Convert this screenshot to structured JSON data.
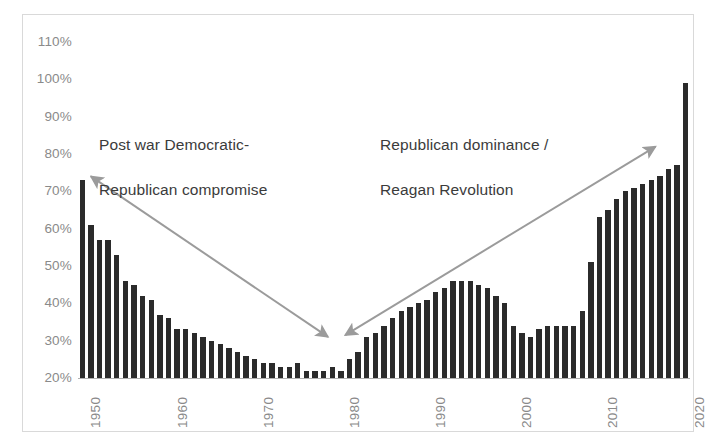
{
  "chart_data": {
    "type": "bar",
    "title": "",
    "subtitle": "",
    "xlabel": "",
    "ylabel": "",
    "ylim": [
      20,
      110
    ],
    "ytick_labels": [
      "110%",
      "100%",
      "90%",
      "80%",
      "70%",
      "60%",
      "50%",
      "40%",
      "30%",
      "20%"
    ],
    "ytick_values": [
      110,
      100,
      90,
      80,
      70,
      60,
      50,
      40,
      30,
      20
    ],
    "xtick_labels": [
      "1950",
      "1960",
      "1970",
      "1980",
      "1990",
      "2000",
      "2010",
      "2020"
    ],
    "xtick_values": [
      1950,
      1960,
      1970,
      1980,
      1990,
      2000,
      2010,
      2020
    ],
    "grid": false,
    "legend": null,
    "bar_color": "#2b2b2b",
    "x": [
      1950,
      1951,
      1952,
      1953,
      1954,
      1955,
      1956,
      1957,
      1958,
      1959,
      1960,
      1961,
      1962,
      1963,
      1964,
      1965,
      1966,
      1967,
      1968,
      1969,
      1970,
      1971,
      1972,
      1973,
      1974,
      1975,
      1976,
      1977,
      1978,
      1979,
      1980,
      1981,
      1982,
      1983,
      1984,
      1985,
      1986,
      1987,
      1988,
      1989,
      1990,
      1991,
      1992,
      1993,
      1994,
      1995,
      1996,
      1997,
      1998,
      1999,
      2000,
      2001,
      2002,
      2003,
      2004,
      2005,
      2006,
      2007,
      2008,
      2009,
      2010,
      2011,
      2012,
      2013,
      2014,
      2015,
      2016,
      2017,
      2018,
      2019,
      2020
    ],
    "values": [
      73,
      61,
      57,
      57,
      53,
      46,
      45,
      42,
      41,
      37,
      36,
      33,
      33,
      32,
      31,
      30,
      29,
      28,
      27,
      26,
      25,
      24,
      24,
      23,
      23,
      24,
      22,
      22,
      22,
      23,
      22,
      25,
      27,
      31,
      32,
      34,
      36,
      38,
      39,
      40,
      41,
      43,
      44,
      46,
      46,
      46,
      45,
      44,
      42,
      40,
      34,
      32,
      31,
      33,
      34,
      34,
      34,
      34,
      38,
      51,
      63,
      65,
      68,
      70,
      71,
      72,
      73,
      74,
      76,
      77,
      99
    ],
    "annotations": [
      {
        "name": "post-war-compromise",
        "text": "Post war Democratic-\nRepublican compromise",
        "arrow": {
          "from_year": 1978.5,
          "from_value": 31,
          "to_year": 1951,
          "to_value": 74,
          "double_headed": true
        },
        "color": "#9b9b9b"
      },
      {
        "name": "republican-dominance",
        "text": "Republican dominance /\nReagan Revolution",
        "arrow": {
          "from_year": 1980.5,
          "from_value": 31.5,
          "to_year": 2016.5,
          "to_value": 82,
          "double_headed": true
        },
        "color": "#9b9b9b"
      }
    ]
  },
  "annotation_left": {
    "line1": "Post war Democratic-",
    "line2": "Republican compromise"
  },
  "annotation_right": {
    "line1": "Republican dominance /",
    "line2": "Reagan Revolution"
  },
  "colors": {
    "bar": "#2b2b2b",
    "arrow": "#9b9b9b",
    "axis_text": "#8a8a8a",
    "annotation_text": "#3b3b3b",
    "frame": "#d9d9d9"
  }
}
